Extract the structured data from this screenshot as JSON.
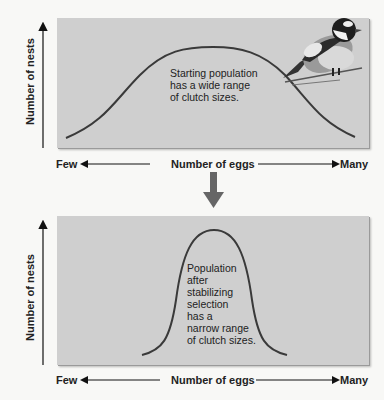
{
  "top_panel": {
    "y_axis_label": "Number of nests",
    "x_axis_label": "Number of eggs",
    "x_left_label": "Few",
    "x_right_label": "Many",
    "annotation": [
      "Starting population",
      "has a wide range",
      "of clutch sizes."
    ],
    "illustration": "bird-on-branch"
  },
  "transition_arrow": "down-arrow",
  "bottom_panel": {
    "y_axis_label": "Number of nests",
    "x_axis_label": "Number of eggs",
    "x_left_label": "Few",
    "x_right_label": "Many",
    "annotation": [
      "Population",
      "after",
      "stabilizing",
      "selection",
      "has a",
      "narrow range",
      "of clutch sizes."
    ]
  },
  "colors": {
    "panel_bg": "#cfcfcf",
    "curve": "#3a3a3a",
    "arrow": "#666666",
    "text": "#222222"
  }
}
